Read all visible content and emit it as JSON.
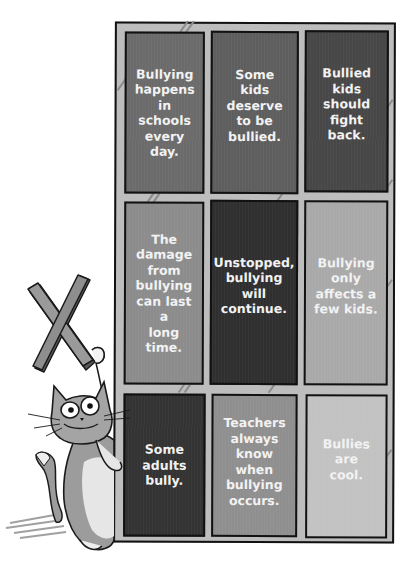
{
  "board": {
    "cells": [
      {
        "text": "Bullying happens in schools every day.",
        "lines": [
          "Bullying",
          "happens",
          "in schools",
          "every day."
        ],
        "shade": "#6b6b6b"
      },
      {
        "text": "Some kids deserve to be bullied.",
        "lines": [
          "Some kids",
          "deserve",
          "to be",
          "bullied."
        ],
        "shade": "#5e5e5e"
      },
      {
        "text": "Bullied kids should fight back.",
        "lines": [
          "Bullied",
          "kids should",
          "fight back."
        ],
        "shade": "#474747"
      },
      {
        "text": "The damage from bullying can last a long time.",
        "lines": [
          "The",
          "damage",
          "from",
          "bullying",
          "can last a",
          "long time."
        ],
        "shade": "#8c8c8c"
      },
      {
        "text": "Unstopped, bullying will continue.",
        "lines": [
          "Unstopped,",
          "bullying",
          "will",
          "continue."
        ],
        "shade": "#2f2f2f"
      },
      {
        "text": "Bullying only affects a few kids.",
        "lines": [
          "Bullying",
          "only",
          "affects a",
          "few kids."
        ],
        "shade": "#a9a9a9"
      },
      {
        "text": "Some adults bully.",
        "lines": [
          "Some",
          "adults",
          "bully."
        ],
        "shade": "#333333"
      },
      {
        "text": "Teachers always know when bullying occurs.",
        "lines": [
          "Teachers",
          "always",
          "know when",
          "bullying",
          "occurs."
        ],
        "shade": "#8f8f8f"
      },
      {
        "text": "Bullies are cool.",
        "lines": [
          "Bullies are",
          "cool."
        ],
        "shade": "#c2c2c2"
      }
    ]
  },
  "illustration": {
    "character": "cartoon cat",
    "prop": "X mark",
    "icon": "x-mark-icon"
  }
}
